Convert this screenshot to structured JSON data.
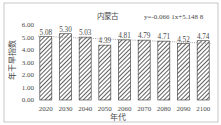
{
  "colors": {
    "background": "#ffffff",
    "frame": "#b9b9b9",
    "text": "#4a4a4a",
    "bar_outline": "#333333",
    "bar_hatch": "#3a3a3a",
    "trendline": "#8a8a8a"
  },
  "chart_data": {
    "type": "bar",
    "title": "内蒙古",
    "annotation": "y=-0.066 1x+5.148 8",
    "xlabel": "年代",
    "ylabel": "年干旱指数",
    "categories": [
      "2020",
      "2030",
      "2040",
      "2050",
      "2060",
      "2070",
      "2080",
      "2090",
      "2100"
    ],
    "values": [
      5.08,
      5.3,
      5.03,
      4.39,
      4.81,
      4.79,
      4.71,
      4.52,
      4.74
    ],
    "value_labels": [
      "5.08",
      "5.30",
      "5.03",
      "4.39",
      "4.81",
      "4.79",
      "4.71",
      "4.52",
      "4.74"
    ],
    "ylim": [
      0,
      6
    ],
    "yticks": [
      "0.00",
      "1.00",
      "2.00",
      "3.00",
      "4.00",
      "5.00",
      "6.00"
    ],
    "grid": false,
    "legend": null,
    "bar_pattern": "diagonal-hatch",
    "trendline": {
      "type": "linear",
      "slope": -0.0661,
      "intercept": 5.1488,
      "style": "dotted"
    }
  }
}
